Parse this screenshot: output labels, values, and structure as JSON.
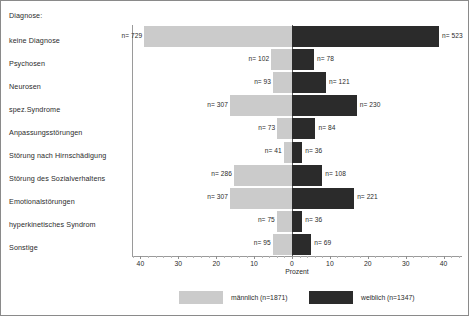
{
  "chart_data": {
    "type": "bar",
    "subtype": "diverging-horizontal-bar",
    "title": "",
    "category_axis_title": "Diagnose:",
    "xlabel": "Prozent",
    "ylabel": "",
    "xlim": [
      -45,
      45
    ],
    "grid": false,
    "legend_position": "bottom",
    "tick_labels": [
      "40",
      "30",
      "20",
      "10",
      "0",
      "10",
      "20",
      "30",
      "40"
    ],
    "tick_values": [
      -40,
      -30,
      -20,
      -10,
      0,
      10,
      20,
      30,
      40
    ],
    "categories": [
      "keine Diagnose",
      "Psychosen",
      "Neurosen",
      "spez.Syndrome",
      "Anpassungsstörungen",
      "Störung nach Hirnschädigung",
      "Störung des Sozialverhaltens",
      "Emotionalstörungen",
      "hyperkinetisches Syndrom",
      "Sonstige"
    ],
    "series": [
      {
        "name": "männlich (n=1871)",
        "side": "left",
        "color": "#cbcbcb",
        "total": 1871,
        "counts": [
          729,
          102,
          93,
          307,
          73,
          41,
          286,
          307,
          75,
          95
        ],
        "count_labels": [
          "n= 729",
          "n= 102",
          "n= 93",
          "n= 307",
          "n= 73",
          "n= 41",
          "n= 286",
          "n= 307",
          "n= 75",
          "n= 95"
        ],
        "values": [
          39.0,
          5.5,
          5.0,
          16.4,
          3.9,
          2.2,
          15.3,
          16.4,
          4.0,
          5.1
        ]
      },
      {
        "name": "weiblich (n=1347)",
        "side": "right",
        "color": "#2b2b2b",
        "total": 1347,
        "counts": [
          523,
          78,
          121,
          230,
          84,
          36,
          108,
          221,
          36,
          69
        ],
        "count_labels": [
          "n= 523",
          "n= 78",
          "n= 121",
          "n= 230",
          "n= 84",
          "n= 36",
          "n= 108",
          "n= 221",
          "n= 36",
          "n= 69"
        ],
        "values": [
          38.8,
          5.8,
          9.0,
          17.1,
          6.2,
          2.7,
          8.0,
          16.4,
          2.7,
          5.1
        ]
      }
    ]
  },
  "legend": {
    "items": [
      {
        "label": "männlich (n=1871)",
        "color": "#cbcbcb"
      },
      {
        "label": "weiblich (n=1347)",
        "color": "#2b2b2b"
      }
    ]
  }
}
